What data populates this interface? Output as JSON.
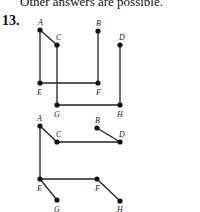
{
  "header_text": "Other answers are possible.",
  "problem_number": "13.",
  "graphs": [
    {
      "name": "graph-top",
      "vertices": [
        {
          "id": "A",
          "x": 40,
          "y": 30,
          "lx": 38,
          "ly": 25
        },
        {
          "id": "B",
          "x": 98,
          "y": 31,
          "lx": 96,
          "ly": 26
        },
        {
          "id": "C",
          "x": 57,
          "y": 45,
          "lx": 56,
          "ly": 40
        },
        {
          "id": "D",
          "x": 120,
          "y": 45,
          "lx": 119,
          "ly": 40
        },
        {
          "id": "E",
          "x": 40,
          "y": 83,
          "lx": 37,
          "ly": 95
        },
        {
          "id": "F",
          "x": 98,
          "y": 83,
          "lx": 96,
          "ly": 95
        },
        {
          "id": "G",
          "x": 57,
          "y": 105,
          "lx": 54,
          "ly": 117
        },
        {
          "id": "H",
          "x": 120,
          "y": 105,
          "lx": 117,
          "ly": 117
        }
      ],
      "edges": [
        [
          "A",
          "C"
        ],
        [
          "A",
          "E"
        ],
        [
          "E",
          "F"
        ],
        [
          "B",
          "F"
        ],
        [
          "C",
          "G"
        ],
        [
          "G",
          "H"
        ],
        [
          "D",
          "H"
        ]
      ]
    },
    {
      "name": "graph-bottom",
      "vertices": [
        {
          "id": "A",
          "x": 40,
          "y": 126,
          "lx": 37,
          "ly": 121
        },
        {
          "id": "B",
          "x": 97,
          "y": 128,
          "lx": 95,
          "ly": 123
        },
        {
          "id": "C",
          "x": 57,
          "y": 142,
          "lx": 56,
          "ly": 137
        },
        {
          "id": "D",
          "x": 120,
          "y": 142,
          "lx": 119,
          "ly": 137
        },
        {
          "id": "E",
          "x": 40,
          "y": 179,
          "lx": 37,
          "ly": 191
        },
        {
          "id": "F",
          "x": 97,
          "y": 179,
          "lx": 95,
          "ly": 191
        },
        {
          "id": "G",
          "x": 57,
          "y": 200,
          "lx": 54,
          "ly": 212
        },
        {
          "id": "H",
          "x": 120,
          "y": 201,
          "lx": 117,
          "ly": 212
        }
      ],
      "edges": [
        [
          "A",
          "C"
        ],
        [
          "C",
          "D"
        ],
        [
          "B",
          "D"
        ],
        [
          "A",
          "E"
        ],
        [
          "E",
          "F"
        ],
        [
          "E",
          "G"
        ],
        [
          "F",
          "H"
        ]
      ]
    }
  ],
  "colors": {
    "edge": "#222222",
    "vertex": "#111111"
  }
}
